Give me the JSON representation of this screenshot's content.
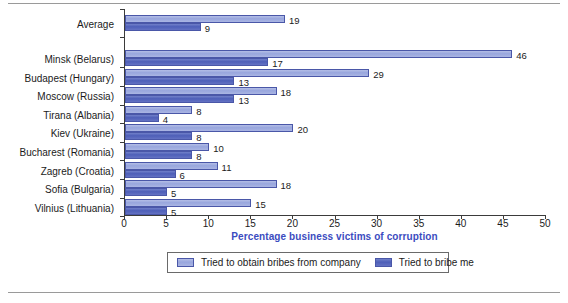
{
  "chart_data": {
    "type": "bar",
    "orientation": "horizontal",
    "title": "",
    "xlabel": "Percentage business victims of corruption",
    "ylabel": "",
    "xlim": [
      0,
      50
    ],
    "xticks": [
      0,
      5,
      10,
      15,
      20,
      25,
      30,
      35,
      40,
      45,
      50
    ],
    "grid": false,
    "legend_position": "bottom",
    "categories": [
      "Average",
      "Minsk (Belarus)",
      "Budapest (Hungary)",
      "Moscow (Russia)",
      "Tirana (Albania)",
      "Kiev (Ukraine)",
      "Bucharest (Romania)",
      "Zagreb (Croatia)",
      "Sofia (Bulgaria)",
      "Vilnius (Lithuania)"
    ],
    "series": [
      {
        "name": "Tried to obtain bribes from company",
        "color": "#98a6dd",
        "values": [
          19,
          46,
          29,
          18,
          8,
          20,
          10,
          11,
          18,
          15
        ]
      },
      {
        "name": "Tried to bribe me",
        "color": "#4e5fb8",
        "values": [
          9,
          17,
          13,
          13,
          4,
          8,
          8,
          6,
          5,
          5
        ]
      }
    ]
  },
  "legend": {
    "entries": [
      {
        "label": "Tried to obtain bribes from company"
      },
      {
        "label": "Tried to bribe me"
      }
    ]
  },
  "colors": {
    "axis_title": "#3b4cc0",
    "series_light": "#98a6dd",
    "series_dark": "#4e5fb8",
    "axis_line": "#3b3b3b"
  }
}
